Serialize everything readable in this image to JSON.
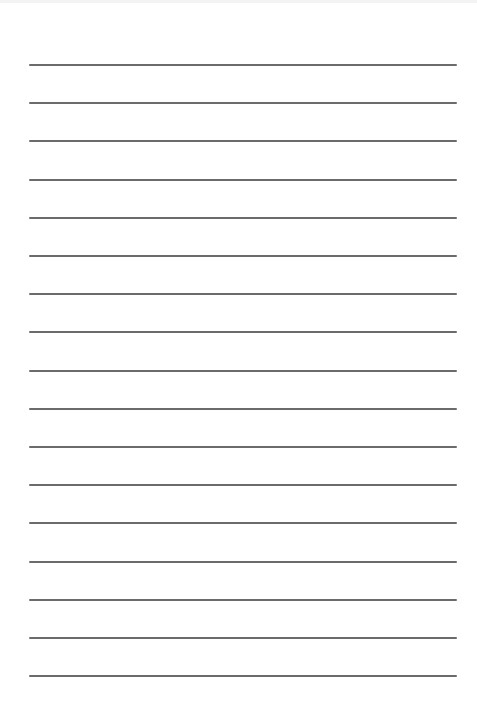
{
  "page": {
    "type": "lined-paper",
    "background": "#ffffff",
    "line_color": "#6b6b6b",
    "line_count": 17,
    "line_left": 29,
    "line_right": 457,
    "line_positions_y": [
      65,
      103,
      141,
      180,
      218,
      256,
      294,
      332,
      371,
      409,
      447,
      485,
      523,
      562,
      600,
      638,
      676
    ]
  }
}
